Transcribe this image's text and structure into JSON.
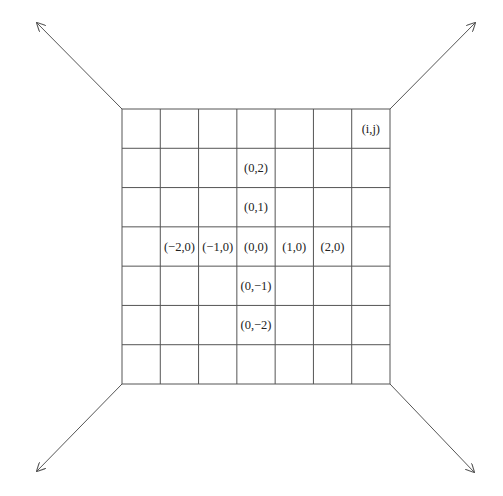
{
  "diagram": {
    "type": "lattice-grid",
    "grid": {
      "rows": 7,
      "cols": 7,
      "left": 122,
      "top": 109,
      "right": 390,
      "bottom": 384
    },
    "line_color": "#555555",
    "arrows": [
      {
        "name": "arrow-top-left",
        "from": [
          122,
          109
        ],
        "to": [
          37,
          23
        ]
      },
      {
        "name": "arrow-top-right",
        "from": [
          390,
          109
        ],
        "to": [
          475,
          23
        ]
      },
      {
        "name": "arrow-bottom-left",
        "from": [
          122,
          384
        ],
        "to": [
          37,
          471
        ]
      },
      {
        "name": "arrow-bottom-right",
        "from": [
          390,
          384
        ],
        "to": [
          474,
          472
        ]
      }
    ],
    "labels": [
      {
        "id": "ij",
        "text": "(i,j)",
        "col": 6,
        "row": 0
      },
      {
        "id": "p0_2",
        "text": "(0,2)",
        "col": 3,
        "row": 1
      },
      {
        "id": "p0_1",
        "text": "(0,1)",
        "col": 3,
        "row": 2
      },
      {
        "id": "pm2_0",
        "text": "(−2,0)",
        "col": 1,
        "row": 3
      },
      {
        "id": "pm1_0",
        "text": "(−1,0)",
        "col": 2,
        "row": 3
      },
      {
        "id": "p0_0",
        "text": "(0,0)",
        "col": 3,
        "row": 3
      },
      {
        "id": "p1_0",
        "text": "(1,0)",
        "col": 4,
        "row": 3
      },
      {
        "id": "p2_0",
        "text": "(2,0)",
        "col": 5,
        "row": 3
      },
      {
        "id": "p0_m1",
        "text": "(0,−1)",
        "col": 3,
        "row": 4
      },
      {
        "id": "p0_m2",
        "text": "(0,−2)",
        "col": 3,
        "row": 5
      }
    ]
  }
}
